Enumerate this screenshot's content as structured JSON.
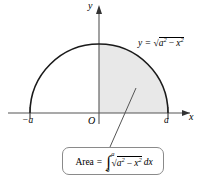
{
  "figure": {
    "background_color": "#ffffff",
    "shaded_region_color": "#e8e8e8",
    "curve_color": "#1a1a1a",
    "axis_color": "#555555",
    "box_border_color": "#8a8a8a",
    "axes": {
      "y_label": "y",
      "x_label": "x",
      "origin_label": "O"
    },
    "ticks": {
      "left_label": "−a",
      "right_label": "a"
    },
    "curve_equation": {
      "lhs": "y",
      "equals": "=",
      "radicand_base": "a",
      "radicand_exponent": "2",
      "minus": "−",
      "subtrahend_base": "x",
      "subtrahend_exponent": "2",
      "plain_text": "y = √(a² − x²)"
    },
    "area_formula": {
      "label": "Area",
      "equals": "=",
      "integral_symbol": "∫",
      "lower_limit": "0",
      "upper_limit": "a",
      "radicand_base": "a",
      "radicand_exponent": "2",
      "minus": "−",
      "subtrahend_base": "x",
      "subtrahend_exponent": "2",
      "differential": "dx",
      "plain_text": "Area = ∫₀ᵃ √(a² − x²) dx"
    },
    "geometry": {
      "center_x": 99,
      "baseline_y": 113,
      "radius": 69,
      "semicircle_left_x": 30,
      "semicircle_right_x": 168,
      "apex_y": 44
    }
  }
}
